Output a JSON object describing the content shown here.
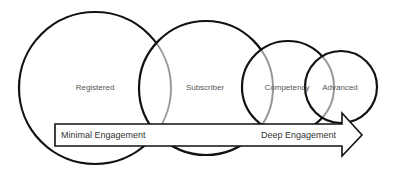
{
  "diagram": {
    "stages": [
      {
        "label": "Registered",
        "cx": 95,
        "cy": 88,
        "r": 76
      },
      {
        "label": "Subscriber",
        "cx": 206,
        "cy": 88,
        "r": 67
      },
      {
        "label": "Competency",
        "cx": 288,
        "cy": 87,
        "r": 46
      },
      {
        "label": "Advanced",
        "cx": 341,
        "cy": 87,
        "r": 36
      }
    ],
    "arrow": {
      "start_label": "Minimal Engagement",
      "end_label": "Deep Engagement",
      "direction": "left-to-right"
    },
    "colors": {
      "outline": "#111111",
      "overlap_outline": "#999999",
      "label_text": "#555555",
      "background": "#ffffff"
    }
  }
}
